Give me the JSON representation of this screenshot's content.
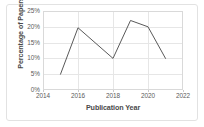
{
  "chart_data": {
    "type": "line",
    "title": "",
    "xlabel": "Publication Year",
    "ylabel": "Percentage of Papers",
    "x": [
      2015,
      2016,
      2018,
      2019,
      2020,
      2021
    ],
    "values": [
      5,
      19.7,
      10,
      22,
      20,
      10
    ],
    "series": [
      {
        "name": "Percentage of Papers",
        "x": [
          2015,
          2016,
          2018,
          2019,
          2020,
          2021
        ],
        "values": [
          5,
          19.7,
          10,
          22,
          20,
          10
        ]
      }
    ],
    "xlim": [
      2014,
      2022
    ],
    "ylim": [
      0,
      25
    ],
    "xticks": [
      2014,
      2016,
      2018,
      2020,
      2022
    ],
    "xtick_labels": [
      "2014",
      "2016",
      "2018",
      "2020",
      "2022"
    ],
    "yticks": [
      0,
      5,
      10,
      15,
      20,
      25
    ],
    "ytick_labels": [
      "0%",
      "5%",
      "10%",
      "15%",
      "20%",
      "25%"
    ],
    "grid": true,
    "legend": false,
    "line_color": "#595959",
    "grid_color": "#e6e6e6",
    "frame_color": "#d9d9d9",
    "background_color": "#ffffff"
  }
}
